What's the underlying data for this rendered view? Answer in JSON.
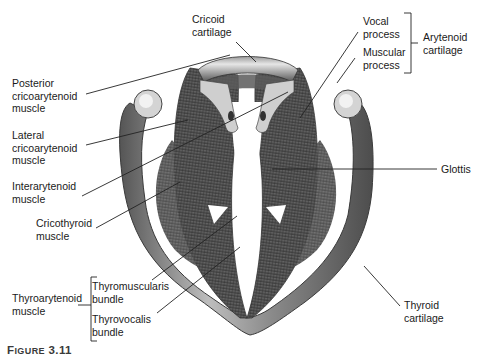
{
  "figure": {
    "caption_prefix": "F",
    "caption_smallcaps": "IGURE",
    "caption_number": "3.11"
  },
  "labels": {
    "cricoid_cartilage": "Cricoid\ncartilage",
    "vocal_process": "Vocal\nprocess",
    "muscular_process": "Muscular\nprocess",
    "arytenoid_cartilage": "Arytenoid\ncartilage",
    "posterior_cricoarytenoid": "Posterior\ncricoarytenoid\nmuscle",
    "lateral_cricoarytenoid": "Lateral\ncricoarytenoid\nmuscle",
    "interarytenoid": "Interarytenoid\nmuscle",
    "cricothyroid": "Cricothyroid\nmuscle",
    "glottis": "Glottis",
    "thyroarytenoid": "Thyroarytenoid\nmuscle",
    "thyromuscularis": "Thyromuscularis\nbundle",
    "thyrovocalis": "Thyrovocalis\nbundle",
    "thyroid_cartilage": "Thyroid\ncartilage"
  },
  "colors": {
    "background": "#ffffff",
    "muscle_dark": "#4a4a4a",
    "muscle_mid": "#6e6e6e",
    "cartilage_light": "#c8c8c8",
    "text": "#1a1a1a",
    "leader_line": "#222222"
  }
}
